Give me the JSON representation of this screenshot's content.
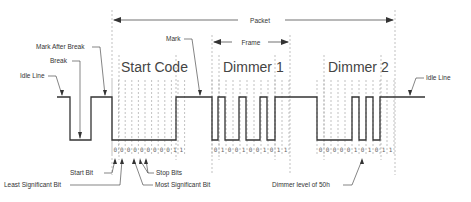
{
  "labels": {
    "packet": "Packet",
    "frame": "Frame",
    "mark": "Mark",
    "mark_after_break": "Mark After Break",
    "break": "Break",
    "idle_line_left": "Idle Line",
    "idle_line_right": "Idle Line",
    "start_code": "Start Code",
    "dimmer1": "Dimmer 1",
    "dimmer2": "Dimmer 2",
    "start_bit": "Start Bit",
    "least_significant_bit": "Least Significant Bit",
    "stop_bits": "Stop Bits",
    "most_significant_bit": "Most Significant Bit",
    "dimmer_level": "Dimmer   level of 50h"
  },
  "bits": {
    "start_code": [
      "0",
      "0",
      "0",
      "0",
      "0",
      "0",
      "0",
      "0",
      "0",
      "1",
      "1"
    ],
    "dimmer1": [
      "0",
      "1",
      "0",
      "0",
      "1",
      "0",
      "0",
      "1",
      "0",
      "1",
      "1"
    ],
    "dimmer2": [
      "0",
      "0",
      "0",
      "0",
      "0",
      "1",
      "0",
      "1",
      "0",
      "1",
      "1"
    ]
  }
}
